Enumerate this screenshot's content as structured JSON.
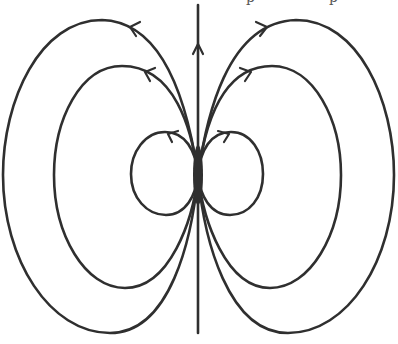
{
  "figure": {
    "title": "",
    "stroke_color": "#2f2f2f",
    "background": "#ffffff",
    "center": {
      "x": 198,
      "y": 175
    },
    "axis": {
      "x": 198,
      "y_top": 5,
      "y_bottom": 333,
      "arrow_direction": "up",
      "arrow_y": 48
    },
    "loops": [
      {
        "name": "outer",
        "left_extent_x": 3,
        "right_extent_x": 394,
        "top_y": 20,
        "bottom_y": 333,
        "arrow_direction_left": "left",
        "arrow_direction_right": "right"
      },
      {
        "name": "middle",
        "left_extent_x": 54,
        "right_extent_x": 341,
        "top_y": 66,
        "bottom_y": 288,
        "arrow_direction_left": "left",
        "arrow_direction_right": "right"
      },
      {
        "name": "inner",
        "left_extent_x": 131,
        "right_extent_x": 263,
        "top_y": 132,
        "bottom_y": 215,
        "arrow_direction_left": "left",
        "arrow_direction_right": "right"
      }
    ],
    "cropped_text_top": "p         p"
  }
}
